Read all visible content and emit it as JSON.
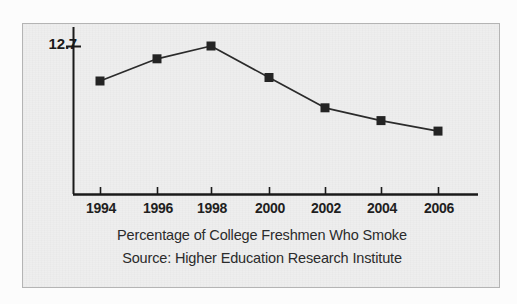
{
  "chart_data": {
    "type": "line",
    "title": "Percentage of College Freshmen Who Smoke",
    "subtitle": "Source: Higher Education Research Institute",
    "xlabel": "",
    "ylabel": "",
    "categories": [
      "1994",
      "1996",
      "1998",
      "2000",
      "2002",
      "2004",
      "2006"
    ],
    "x": [
      1994,
      1996,
      1998,
      2000,
      2002,
      2004,
      2006
    ],
    "values": [
      9.7,
      11.6,
      12.7,
      10.0,
      7.4,
      6.3,
      5.4
    ],
    "series": [
      {
        "name": "Percentage of College Freshmen Who Smoke",
        "values": [
          9.7,
          11.6,
          12.7,
          10.0,
          7.4,
          6.3,
          5.4
        ]
      }
    ],
    "y_tick_labels": [
      "12.7"
    ],
    "y_ticks": [
      12.7
    ],
    "ylim": [
      0,
      12.7
    ],
    "xlim": [
      1993,
      2007
    ],
    "grid": false,
    "legend": false,
    "legend_position": "none",
    "marker": "square",
    "line_color": "#2b2b2b",
    "marker_color": "#242424",
    "annotations": []
  },
  "figure": {
    "background_color": "#eeeeee",
    "border_color": "#b4b4b4"
  },
  "axis": {
    "y_tick_label": "12.7",
    "x_tick_labels": [
      "1994",
      "1996",
      "1998",
      "2000",
      "2002",
      "2004",
      "2006"
    ],
    "axis_color": "#1a1a1a"
  },
  "caption": {
    "line1": "Percentage of College Freshmen Who Smoke",
    "line2": "Source: Higher Education Research Institute"
  }
}
